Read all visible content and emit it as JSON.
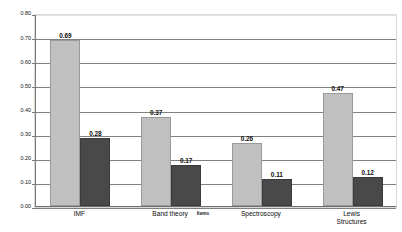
{
  "chart_data": {
    "type": "bar",
    "title": "",
    "subtitle": "",
    "xlabel": "Items",
    "ylabel": "Difficulty Index",
    "ylim": [
      0.0,
      0.8
    ],
    "ytick_labels": [
      "0.80",
      "0.70",
      "0.60",
      "0.50",
      "0.40",
      "0.30",
      "0.20",
      "0.10",
      "0.00"
    ],
    "ytick_values": [
      0.8,
      0.7,
      0.6,
      0.5,
      0.4,
      0.3,
      0.2,
      0.1,
      0.0
    ],
    "grid": true,
    "legend": "none",
    "categories": [
      "IMF",
      "Band theory",
      "Spectroscopy",
      "Lewis Structures"
    ],
    "category_label_lines": [
      [
        "IMF"
      ],
      [
        "Band theory"
      ],
      [
        "Spectroscopy"
      ],
      [
        "Lewis",
        "Structures"
      ]
    ],
    "series": [
      {
        "name": "Series 1",
        "color": "#c0c0c0",
        "values": [
          0.69,
          0.37,
          0.26,
          0.47
        ],
        "labels": [
          "0.69",
          "0.37",
          "0.26",
          "0.47"
        ]
      },
      {
        "name": "Series 2",
        "color": "#494949",
        "values": [
          0.28,
          0.17,
          0.11,
          0.12
        ],
        "labels": [
          "0.28",
          "0.17",
          "0.11",
          "0.12"
        ]
      }
    ]
  }
}
